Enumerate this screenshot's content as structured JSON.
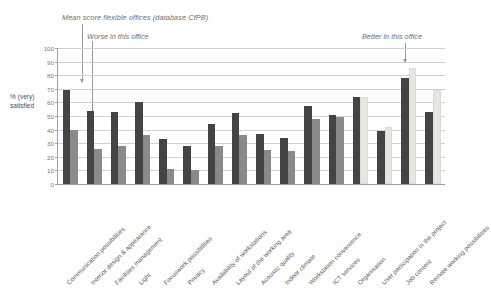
{
  "chart_data": {
    "type": "bar",
    "title": "Mean score flexible offices (database CfPB)",
    "xlabel": "",
    "ylabel": "% (very) satisfied",
    "ylim": [
      0,
      100
    ],
    "ytick_step": 10,
    "yticks": [
      0,
      10,
      20,
      30,
      40,
      50,
      60,
      70,
      80,
      90,
      100
    ],
    "grid": true,
    "legend_position": "none",
    "categories": [
      "Communication possibilities",
      "Interior design & appearance",
      "Facilities management",
      "Light",
      "Focuswork possibilities",
      "Privacy",
      "Availability of workstations",
      "Layout of the working area",
      "Acoustic quality",
      "Indoor climate",
      "Workstation convenience",
      "ICT services",
      "Organisation",
      "User participation in the project",
      "Job content",
      "Remote working possibilities"
    ],
    "series": [
      {
        "name": "This office",
        "color": "#444444",
        "values": [
          69,
          54,
          53,
          60,
          33,
          28,
          44,
          52,
          37,
          34,
          57,
          51,
          64,
          39,
          78,
          53
        ]
      },
      {
        "name": "Mean score flexible offices (database CfPB)",
        "color": "#8a8a8a",
        "alt_color": "#e8e6e0",
        "values": [
          40,
          26,
          28,
          36,
          11,
          10,
          28,
          36,
          25,
          24,
          48,
          49,
          64,
          42,
          85,
          69
        ],
        "alt_from_index": 12
      }
    ],
    "annotations": [
      {
        "text": "Worse in this office",
        "target": "left"
      },
      {
        "text": "Better in this office",
        "target": "right"
      }
    ]
  },
  "colors": {
    "series_dark": "#444444",
    "series_gray": "#8a8a8a",
    "series_light": "#e8e6e0",
    "gridline": "#d2d2d2",
    "axis": "#9e9e9e",
    "text": "#5a5a5a",
    "annotation_text": "#6f6f6f"
  }
}
